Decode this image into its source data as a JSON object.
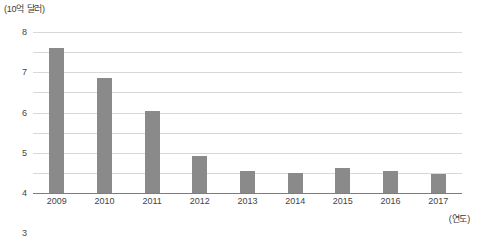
{
  "chart_data": {
    "type": "bar",
    "title": "",
    "subtitle": "",
    "unit_label": "(10억 달러)",
    "xlabel": "(연도)",
    "ylabel": "",
    "categories": [
      "2009",
      "2010",
      "2011",
      "2012",
      "2013",
      "2014",
      "2015",
      "2016",
      "2017"
    ],
    "values": [
      7.2,
      5.7,
      4.1,
      1.85,
      1.1,
      1.0,
      1.25,
      1.1,
      0.95
    ],
    "ylim": [
      0,
      8
    ],
    "ytick_labels": [
      "0",
      "1",
      "2",
      "3",
      "4",
      "5",
      "6",
      "7",
      "8"
    ],
    "ytick_values": [
      0,
      1,
      2,
      3,
      4,
      5,
      6,
      7,
      8
    ],
    "grid": true,
    "legend": false,
    "legend_position": "none",
    "bar_color": "#8a8a8a",
    "grid_color": "#d8d8d8",
    "axis_color": "#7d7d7d",
    "text_color": "#444444"
  }
}
